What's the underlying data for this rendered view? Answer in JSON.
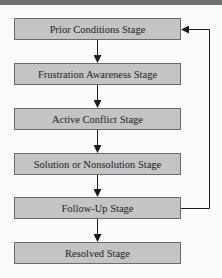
{
  "diagram": {
    "type": "flowchart",
    "stages": [
      {
        "label": "Prior Conditions Stage",
        "top": 18
      },
      {
        "label": "Frustration Awareness Stage",
        "top": 63
      },
      {
        "label": "Active Conflict Stage",
        "top": 108
      },
      {
        "label": "Solution or Nonsolution Stage",
        "top": 153
      },
      {
        "label": "Follow-Up Stage",
        "top": 197
      },
      {
        "label": "Resolved Stage",
        "top": 242
      }
    ],
    "edges": [
      {
        "from": "Prior Conditions Stage",
        "to": "Frustration Awareness Stage"
      },
      {
        "from": "Frustration Awareness Stage",
        "to": "Active Conflict Stage"
      },
      {
        "from": "Active Conflict Stage",
        "to": "Solution or Nonsolution Stage"
      },
      {
        "from": "Solution or Nonsolution Stage",
        "to": "Follow-Up Stage"
      },
      {
        "from": "Follow-Up Stage",
        "to": "Resolved Stage"
      },
      {
        "from": "Follow-Up Stage",
        "to": "Prior Conditions Stage",
        "kind": "feedback-loop"
      }
    ],
    "colors": {
      "box_fill": "#c4c4c4",
      "box_border": "#6a6a6a",
      "line": "#1a1a1a",
      "top_bar": "#6e6e6e"
    }
  }
}
